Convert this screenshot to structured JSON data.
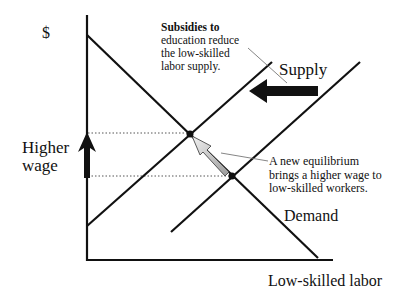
{
  "diagram": {
    "y_axis_label": "$",
    "x_axis_label": "Low-skilled labor",
    "higher_wage_label": [
      "Higher",
      "wage"
    ],
    "supply_label": "Supply",
    "demand_label": "Demand",
    "note_subsidies": {
      "line1": "Subsidies to",
      "line2": "education reduce",
      "line3": "the low-skilled",
      "line4": "labor supply."
    },
    "note_equilibrium": {
      "line1": "A new equilibrium",
      "line2": "brings a higher wage to",
      "line3": "low-skilled workers."
    },
    "curves": {
      "demand": {
        "from": [
          87,
          35
        ],
        "to": [
          318,
          258
        ]
      },
      "supply_original": {
        "from": [
          171,
          232
        ],
        "to": [
          360,
          62
        ]
      },
      "supply_new": {
        "from": [
          87,
          226
        ],
        "to": [
          272,
          62
        ]
      }
    },
    "equilibria": {
      "new": {
        "x": 190,
        "y": 134
      },
      "original": {
        "x": 232,
        "y": 176
      }
    },
    "colors": {
      "line": "#111111",
      "dotted": "#555555",
      "hatched_arrow_fill": "#cfcfcf",
      "background": "#ffffff"
    }
  }
}
